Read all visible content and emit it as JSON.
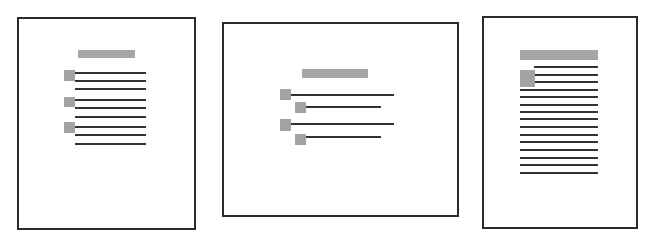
{
  "figure": {
    "colors": {
      "border": "#2a2a2a",
      "placeholder": "#a6a6a6",
      "line": "#333333",
      "background": "#ffffff"
    }
  },
  "panels": [
    {
      "name": "portrait-page-bulleted-list",
      "frame": {
        "x": 17,
        "y": 17,
        "w": 179,
        "h": 213
      },
      "title_bar": {
        "x": 78,
        "y": 50,
        "w": 57,
        "h": 8
      },
      "squares": [
        {
          "x": 64,
          "y": 70,
          "w": 11,
          "h": 11
        },
        {
          "x": 64,
          "y": 97,
          "w": 11,
          "h": 10
        },
        {
          "x": 64,
          "y": 122,
          "w": 11,
          "h": 11
        }
      ],
      "lines": [
        {
          "x": 75,
          "y": 72,
          "w": 71
        },
        {
          "x": 75,
          "y": 80,
          "w": 71
        },
        {
          "x": 75,
          "y": 88,
          "w": 71
        },
        {
          "x": 75,
          "y": 99,
          "w": 71
        },
        {
          "x": 75,
          "y": 107,
          "w": 71
        },
        {
          "x": 75,
          "y": 116,
          "w": 71
        },
        {
          "x": 75,
          "y": 126,
          "w": 71
        },
        {
          "x": 75,
          "y": 134,
          "w": 71
        },
        {
          "x": 75,
          "y": 143,
          "w": 71
        }
      ]
    },
    {
      "name": "landscape-page-nested-list",
      "frame": {
        "x": 222,
        "y": 22,
        "w": 237,
        "h": 195
      },
      "title_bar": {
        "x": 302,
        "y": 69,
        "w": 66,
        "h": 9
      },
      "squares": [
        {
          "x": 280,
          "y": 89,
          "w": 11,
          "h": 11
        },
        {
          "x": 295,
          "y": 102,
          "w": 11,
          "h": 11
        },
        {
          "x": 280,
          "y": 119,
          "w": 11,
          "h": 12
        },
        {
          "x": 295,
          "y": 134,
          "w": 11,
          "h": 11
        }
      ],
      "lines": [
        {
          "x": 291,
          "y": 94,
          "w": 103
        },
        {
          "x": 306,
          "y": 106,
          "w": 75
        },
        {
          "x": 291,
          "y": 123,
          "w": 103
        },
        {
          "x": 306,
          "y": 136,
          "w": 75
        }
      ]
    },
    {
      "name": "portrait-page-text-with-image",
      "frame": {
        "x": 482,
        "y": 16,
        "w": 156,
        "h": 213
      },
      "title_bar": {
        "x": 520,
        "y": 50,
        "w": 78,
        "h": 10
      },
      "squares": [
        {
          "x": 520,
          "y": 70,
          "w": 15,
          "h": 17
        }
      ],
      "lines": [
        {
          "x": 534,
          "y": 66,
          "w": 64
        },
        {
          "x": 534,
          "y": 74,
          "w": 64
        },
        {
          "x": 534,
          "y": 81,
          "w": 64
        },
        {
          "x": 520,
          "y": 89,
          "w": 78
        },
        {
          "x": 520,
          "y": 96,
          "w": 78
        },
        {
          "x": 520,
          "y": 104,
          "w": 78
        },
        {
          "x": 520,
          "y": 111,
          "w": 78
        },
        {
          "x": 520,
          "y": 118,
          "w": 78
        },
        {
          "x": 520,
          "y": 126,
          "w": 78
        },
        {
          "x": 520,
          "y": 134,
          "w": 78
        },
        {
          "x": 520,
          "y": 141,
          "w": 78
        },
        {
          "x": 520,
          "y": 149,
          "w": 78
        },
        {
          "x": 520,
          "y": 157,
          "w": 78
        },
        {
          "x": 520,
          "y": 164,
          "w": 78
        },
        {
          "x": 520,
          "y": 172,
          "w": 78
        }
      ]
    }
  ]
}
